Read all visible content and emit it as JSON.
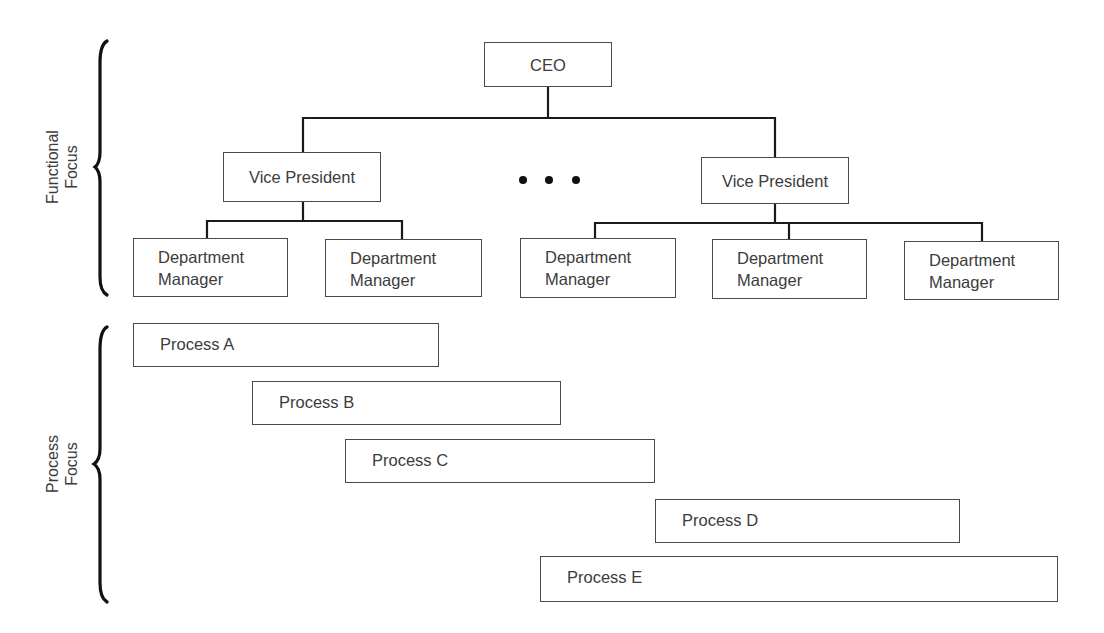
{
  "diagram": {
    "type": "org-chart-with-process-overlay",
    "sections": {
      "functional": {
        "label_line1": "Functional",
        "label_line2": "Focus"
      },
      "process": {
        "label_line1": "Process",
        "label_line2": "Focus"
      }
    },
    "org_chart": {
      "ceo": {
        "label": "CEO"
      },
      "ellipsis": "• • •",
      "vice_presidents": [
        {
          "label": "Vice President",
          "departments": [
            {
              "line1": "Department",
              "line2": "Manager"
            },
            {
              "line1": "Department",
              "line2": "Manager"
            }
          ]
        },
        {
          "label": "Vice President",
          "departments": [
            {
              "line1": "Department",
              "line2": "Manager"
            },
            {
              "line1": "Department",
              "line2": "Manager"
            },
            {
              "line1": "Department",
              "line2": "Manager"
            }
          ]
        }
      ]
    },
    "processes": [
      {
        "label": "Process A"
      },
      {
        "label": "Process B"
      },
      {
        "label": "Process C"
      },
      {
        "label": "Process D"
      },
      {
        "label": "Process E"
      }
    ]
  },
  "colors": {
    "line": "#1a1a1a",
    "box_border": "#4a4a4a",
    "text": "#3c3c3c",
    "background": "#ffffff"
  }
}
